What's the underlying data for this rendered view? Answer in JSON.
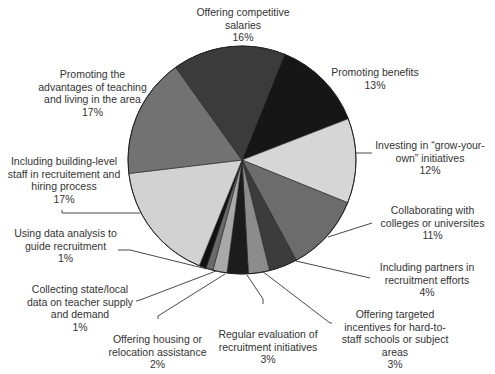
{
  "chart_data": {
    "type": "pie",
    "title": "",
    "start_angle_deg": 22,
    "direction": "clockwise",
    "slices": [
      {
        "label": "Promoting benefits",
        "value": 13,
        "pct": "13%",
        "color": "#161616"
      },
      {
        "label": "Investing in “grow-your-own” initiatives",
        "value": 12,
        "pct": "12%",
        "color": "#d6d6d6"
      },
      {
        "label": "Collaborating with colleges or universites",
        "value": 11,
        "pct": "11%",
        "color": "#6c6c6c"
      },
      {
        "label": "Including partners in recruitment efforts",
        "value": 4,
        "pct": "4%",
        "color": "#3c3c3c"
      },
      {
        "label": "Offering targeted incentives for hard-to-staff schools or subject areas",
        "value": 3,
        "pct": "3%",
        "color": "#8c8c8c"
      },
      {
        "label": "Regular evaluation of recruitment initiatives",
        "value": 3,
        "pct": "3%",
        "color": "#1c1c1c"
      },
      {
        "label": "Offering housing or relocation assistance",
        "value": 2,
        "pct": "2%",
        "color": "#a9a9a9"
      },
      {
        "label": "Collecting state/local data on teacher supply and demand",
        "value": 1,
        "pct": "1%",
        "color": "#6a6a6a"
      },
      {
        "label": "Using data analysis to guide recruitment",
        "value": 1,
        "pct": "1%",
        "color": "#121212"
      },
      {
        "label": "Including building-level staff in recruitement and hiring process",
        "value": 17,
        "pct": "17%",
        "color": "#d2d2d2"
      },
      {
        "label": "Promoting the advantages of teaching and living in the area",
        "value": 17,
        "pct": "17%",
        "color": "#727272"
      },
      {
        "label": "Offering competitive salaries",
        "value": 16,
        "pct": "16%",
        "color": "#3b3b3b"
      }
    ],
    "legend": "none (direct labels with leader lines)"
  },
  "labels": {
    "salaries": {
      "lines": [
        "Offering competitive",
        "salaries"
      ],
      "pct": "16%"
    },
    "benefits": {
      "lines": [
        "Promoting benefits"
      ],
      "pct": "13%"
    },
    "grow": {
      "lines": [
        "Investing in “grow-your-",
        "own” initiatives"
      ],
      "pct": "12%"
    },
    "collab": {
      "lines": [
        "Collaborating with",
        "colleges or universites"
      ],
      "pct": "11%"
    },
    "partners": {
      "lines": [
        "Including partners in",
        "recruitment efforts"
      ],
      "pct": "4%"
    },
    "incentives": {
      "lines": [
        "Offering targeted",
        "incentives for hard-to-",
        "staff schools or subject",
        "areas"
      ],
      "pct": "3%"
    },
    "evaluation": {
      "lines": [
        "Regular evaluation of",
        "recruitment initiatives"
      ],
      "pct": "3%"
    },
    "housing": {
      "lines": [
        "Offering housing or",
        "relocation assistance"
      ],
      "pct": "2%"
    },
    "collecting": {
      "lines": [
        "Collecting state/local",
        "data on teacher supply",
        "and demand"
      ],
      "pct": "1%"
    },
    "analysis": {
      "lines": [
        "Using data analysis to",
        "guide recruitment"
      ],
      "pct": "1%"
    },
    "building": {
      "lines": [
        "Including building-level",
        "staff in recruitement and",
        "hiring process"
      ],
      "pct": "17%"
    },
    "advantages": {
      "lines": [
        "Promoting the",
        "advantages of teaching",
        "and living in the area"
      ],
      "pct": "17%"
    }
  }
}
